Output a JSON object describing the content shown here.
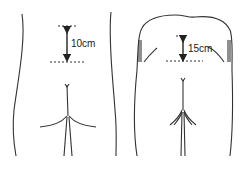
{
  "diagram": {
    "panels": [
      {
        "name": "left-figure",
        "measurement_label": "10cm"
      },
      {
        "name": "right-figure",
        "measurement_label": "15cm"
      }
    ],
    "colors": {
      "stroke": "#333333",
      "background": "#ffffff"
    }
  }
}
